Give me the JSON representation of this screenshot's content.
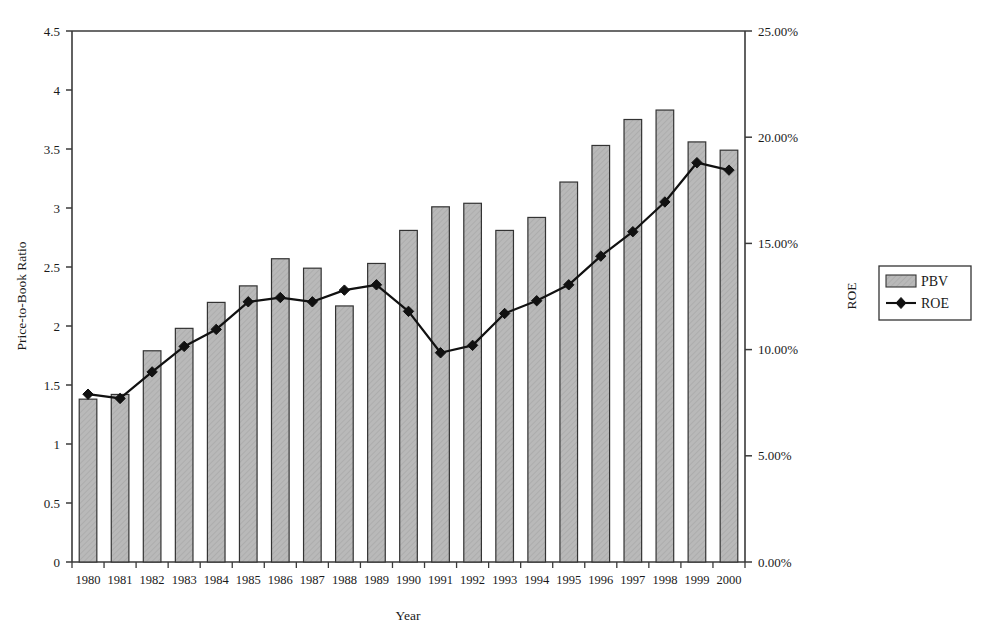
{
  "chart_data": {
    "type": "bar",
    "title": "",
    "subtitle": "",
    "xlabel": "Year",
    "ylabel": "Price-to-Book Ratio",
    "y2label": "ROE",
    "grid": false,
    "legend_position": "right",
    "categories": [
      "1980",
      "1981",
      "1982",
      "1983",
      "1984",
      "1985",
      "1986",
      "1987",
      "1988",
      "1989",
      "1990",
      "1991",
      "1992",
      "1993",
      "1994",
      "1995",
      "1996",
      "1997",
      "1998",
      "1999",
      "2000"
    ],
    "ylim": [
      0,
      4.5
    ],
    "ytick_labels": [
      "0",
      "0.5",
      "1",
      "1.5",
      "2",
      "2.5",
      "3",
      "3.5",
      "4",
      "4.5"
    ],
    "ytick_values": [
      0,
      0.5,
      1,
      1.5,
      2,
      2.5,
      3,
      3.5,
      4,
      4.5
    ],
    "y2lim": [
      0,
      25
    ],
    "y2tick_labels": [
      "0.00%",
      "5.00%",
      "10.00%",
      "15.00%",
      "20.00%",
      "25.00%"
    ],
    "y2tick_values": [
      0,
      5,
      10,
      15,
      20,
      25
    ],
    "series": [
      {
        "name": "PBV",
        "kind": "bar",
        "axis": "left",
        "color": "#b5b5b5",
        "edge_color": "#333333",
        "values": [
          1.38,
          1.42,
          1.79,
          1.98,
          2.2,
          2.34,
          2.57,
          2.49,
          2.17,
          2.53,
          2.81,
          3.01,
          3.04,
          2.81,
          2.92,
          3.22,
          3.53,
          3.75,
          3.83,
          3.56,
          3.49
        ]
      },
      {
        "name": "ROE",
        "kind": "line",
        "axis": "right",
        "color": "#111111",
        "marker": "diamond",
        "values": [
          7.9,
          7.7,
          8.95,
          10.15,
          10.95,
          12.25,
          12.45,
          12.25,
          12.8,
          13.05,
          11.8,
          9.85,
          10.2,
          11.7,
          12.3,
          13.05,
          14.4,
          15.55,
          16.95,
          18.8,
          18.45
        ]
      }
    ],
    "legend": [
      {
        "label": "PBV",
        "type": "swatch",
        "color": "#b5b5b5"
      },
      {
        "label": "ROE",
        "type": "line-marker",
        "color": "#111111"
      }
    ]
  }
}
